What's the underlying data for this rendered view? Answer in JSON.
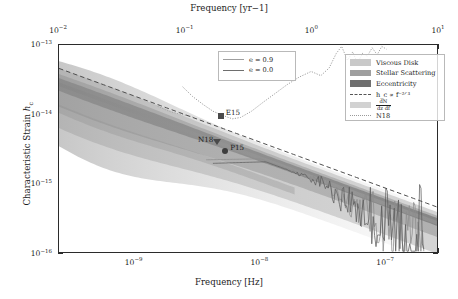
{
  "chart_data": {
    "type": "line",
    "title": "",
    "xlabel": "Frequency [Hz]",
    "xlabel_top": "Frequency [yr−1]",
    "ylabel": "Characteristic Strain h_c",
    "xscale": "log",
    "yscale": "log",
    "xlim": [
      3.2e-10,
      2.6e-07
    ],
    "ylim": [
      1e-16,
      1e-13
    ],
    "grid": false,
    "xticks_bottom": [
      "10−9",
      "10−8",
      "10−7"
    ],
    "xtick_bottom_values": [
      1e-09,
      1e-08,
      1e-07
    ],
    "xticks_top": [
      "10−2",
      "10−1",
      "10⁰",
      "10¹"
    ],
    "xtick_top_values": [
      0.01,
      0.1,
      1.0,
      10.0
    ],
    "yticks": [
      "10−13",
      "10−14",
      "10−15",
      "10−16"
    ],
    "ytick_values": [
      1e-13,
      1e-14,
      1e-15,
      1e-16
    ],
    "legend_position": "upper-right",
    "series": [
      {
        "name": "Viscous Disk",
        "type": "band",
        "color": "#c9c9c9"
      },
      {
        "name": "Stellar Scattering",
        "type": "band",
        "color": "#a2a2a2"
      },
      {
        "name": "Eccentricity",
        "type": "band",
        "color": "#787878"
      },
      {
        "name": "h_c ∝ f^−2/3",
        "type": "dashed-line",
        "color": "#555555"
      },
      {
        "name": "dN/dzdf",
        "type": "density",
        "color": "#bdbdbd"
      },
      {
        "name": "N18",
        "type": "dotted-line",
        "color": "#9a9a9a"
      },
      {
        "name": "e = 0.9",
        "type": "line",
        "color": "#8a8a8a"
      },
      {
        "name": "e = 0.0",
        "type": "line",
        "color": "#6e6e6e"
      }
    ],
    "annotations": [
      {
        "label": "E15",
        "marker": "square",
        "x": 6e-09,
        "y": 9.5e-15
      },
      {
        "label": "N18",
        "marker": "triangle",
        "x": 5.6e-09,
        "y": 4.1e-15
      },
      {
        "label": "P15",
        "marker": "circle",
        "x": 6.5e-09,
        "y": 3e-15
      }
    ]
  },
  "axes": {
    "top_title": "Frequency [yr−1]",
    "bottom_title": "Frequency [Hz]",
    "y_title_pre": "Characteristic Strain ",
    "y_title_sym": "h",
    "y_title_sub": "c",
    "x_top_ticks": [
      {
        "label_base": "10",
        "label_exp": "−2",
        "pos_pct": 0.0
      },
      {
        "label_base": "10",
        "label_exp": "−1",
        "pos_pct": 33.33
      },
      {
        "label_base": "10",
        "label_exp": "0",
        "pos_pct": 66.66
      },
      {
        "label_base": "10",
        "label_exp": "1",
        "pos_pct": 100.0
      }
    ],
    "x_bottom_ticks": [
      {
        "label_base": "10",
        "label_exp": "−9",
        "pos_pct": 19.9
      },
      {
        "label_base": "10",
        "label_exp": "−8",
        "pos_pct": 53.0
      },
      {
        "label_base": "10",
        "label_exp": "−7",
        "pos_pct": 86.1
      }
    ],
    "y_ticks": [
      {
        "label_base": "10",
        "label_exp": "−13",
        "pos_pct": 0.0
      },
      {
        "label_base": "10",
        "label_exp": "−14",
        "pos_pct": 33.33
      },
      {
        "label_base": "10",
        "label_exp": "−15",
        "pos_pct": 66.66
      },
      {
        "label_base": "10",
        "label_exp": "−16",
        "pos_pct": 100.0
      }
    ]
  },
  "legend_eccentricity": {
    "items": [
      {
        "label": "e = 0.9",
        "color": "#9e9e9e"
      },
      {
        "label": "e = 0.0",
        "color": "#6e6e6e"
      }
    ]
  },
  "legend_main": {
    "items": [
      {
        "label": "Viscous Disk",
        "kind": "swatch",
        "color": "#c9c9c9"
      },
      {
        "label": "Stellar Scattering",
        "kind": "swatch",
        "color": "#9f9f9f"
      },
      {
        "label": "Eccentricity",
        "kind": "swatch",
        "color": "#6f6f6f"
      },
      {
        "label": "h_c ∝ f⁻²ᐟ³",
        "kind": "dashed",
        "color": "#555555"
      },
      {
        "label": "dN/dzdf",
        "kind": "swatch",
        "color": "#d2d2d2"
      },
      {
        "label": "N18",
        "kind": "dotted",
        "color": "#9a9a9a"
      }
    ]
  },
  "annotations": {
    "e15": "E15",
    "n18": "N18",
    "p15": "P15"
  }
}
